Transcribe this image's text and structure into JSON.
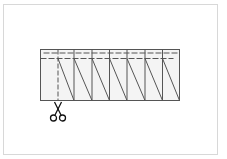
{
  "diagram": {
    "colors": {
      "frame": "#d8d8d8",
      "strip_fill": "#f4f4f4",
      "line": "#555555",
      "scissors": "#111111"
    },
    "frame": {
      "x": 3.5,
      "y": 4.5,
      "w": 214,
      "h": 150
    },
    "strip": {
      "x": 40.5,
      "y": 49.5,
      "w": 139,
      "h": 51
    },
    "panel_dividers_x": [
      74,
      92,
      109.5,
      127,
      145,
      162.5
    ],
    "cut_line_x": 58,
    "fold_lines_y": [
      53,
      58.5
    ],
    "diagonals": [
      {
        "x1": 58,
        "x2": 74
      },
      {
        "x1": 74,
        "x2": 92
      },
      {
        "x1": 92,
        "x2": 109.5
      },
      {
        "x1": 109.5,
        "x2": 127
      },
      {
        "x1": 127,
        "x2": 145
      },
      {
        "x1": 145,
        "x2": 162.5
      },
      {
        "x1": 162.5,
        "x2": 179.5
      }
    ],
    "scissors_icon": {
      "x": 58,
      "y": 102
    }
  }
}
